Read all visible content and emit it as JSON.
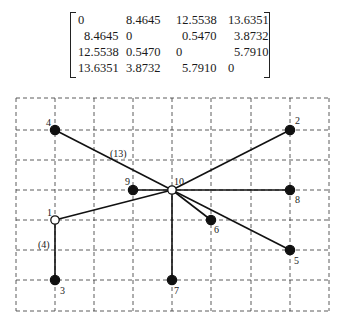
{
  "matrix": {
    "rows": [
      [
        "0",
        "8.4645",
        "12.5538",
        "13.6351"
      ],
      [
        "8.4645",
        "0",
        "0.5470",
        "3.8732"
      ],
      [
        "12.5538",
        "0.5470",
        "0",
        "5.7910"
      ],
      [
        "13.6351",
        "3.8732",
        "5.7910",
        "0"
      ]
    ]
  },
  "diagram": {
    "grid": {
      "x_lines": [
        16,
        55,
        94,
        133,
        172,
        211,
        251,
        290,
        329
      ],
      "y_lines": [
        98,
        130,
        160,
        190,
        220,
        250,
        280,
        311
      ],
      "style": "dashed"
    },
    "nodes": [
      {
        "id": "1",
        "label": "1",
        "x": 55,
        "y": 220,
        "type": "open",
        "label_dx": -8,
        "label_dy": -4
      },
      {
        "id": "2",
        "label": "2",
        "x": 290,
        "y": 130,
        "type": "filled",
        "label_dx": 5,
        "label_dy": -6
      },
      {
        "id": "3",
        "label": "3",
        "x": 55,
        "y": 280,
        "type": "filled",
        "label_dx": 5,
        "label_dy": 14
      },
      {
        "id": "4",
        "label": "4",
        "x": 55,
        "y": 130,
        "type": "filled",
        "label_dx": -9,
        "label_dy": -4
      },
      {
        "id": "5",
        "label": "5",
        "x": 290,
        "y": 250,
        "type": "filled",
        "label_dx": 4,
        "label_dy": 14
      },
      {
        "id": "6",
        "label": "6",
        "x": 211,
        "y": 220,
        "type": "filled",
        "label_dx": 3,
        "label_dy": 13
      },
      {
        "id": "7",
        "label": "7",
        "x": 172,
        "y": 280,
        "type": "filled",
        "label_dx": 2,
        "label_dy": 14
      },
      {
        "id": "8",
        "label": "8",
        "x": 290,
        "y": 190,
        "type": "filled",
        "label_dx": 5,
        "label_dy": 13
      },
      {
        "id": "9",
        "label": "9",
        "x": 133,
        "y": 190,
        "type": "filled",
        "label_dx": -8,
        "label_dy": -5
      },
      {
        "id": "10",
        "label": "10",
        "x": 172,
        "y": 190,
        "type": "open",
        "label_dx": 2,
        "label_dy": -5
      }
    ],
    "edges": [
      [
        "4",
        "10"
      ],
      [
        "2",
        "10"
      ],
      [
        "9",
        "10"
      ],
      [
        "8",
        "10"
      ],
      [
        "1",
        "10"
      ],
      [
        "6",
        "10"
      ],
      [
        "5",
        "10"
      ],
      [
        "7",
        "10"
      ],
      [
        "1",
        "3"
      ]
    ],
    "annotations": [
      {
        "text": "(13)",
        "x": 110,
        "y": 157
      },
      {
        "text": "(4)",
        "x": 38,
        "y": 248
      }
    ]
  }
}
